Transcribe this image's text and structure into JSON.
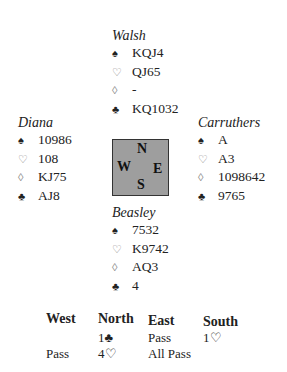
{
  "header": {
    "faded_text": ""
  },
  "hands": {
    "north": {
      "name": "Walsh",
      "spades": "KQJ4",
      "hearts": "QJ65",
      "diamonds": "-",
      "clubs": "KQ1032"
    },
    "west": {
      "name": "Diana",
      "spades": "10986",
      "hearts": "108",
      "diamonds": "KJ75",
      "clubs": "AJ8"
    },
    "east": {
      "name": "Carruthers",
      "spades": "A",
      "hearts": "A3",
      "diamonds": "1098642",
      "clubs": "9765"
    },
    "south": {
      "name": "Beasley",
      "spades": "7532",
      "hearts": "K9742",
      "diamonds": "AQ3",
      "clubs": "4"
    }
  },
  "suits": {
    "spades": "♠",
    "hearts": "♡",
    "diamonds": "◊",
    "clubs": "♣"
  },
  "compass": {
    "n": "N",
    "w": "W",
    "e": "E",
    "s": "S",
    "fill": "#9e9e9e"
  },
  "auction": {
    "headers": [
      "West",
      "North",
      "East",
      "South"
    ],
    "rows": [
      [
        "",
        "1♣",
        "Pass",
        "1♡"
      ],
      [
        "Pass",
        "4♡",
        "All Pass",
        ""
      ]
    ]
  }
}
